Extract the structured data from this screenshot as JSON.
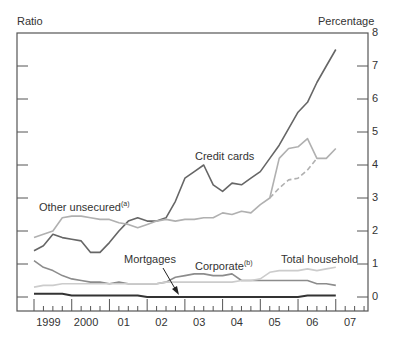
{
  "chart_data": {
    "type": "line",
    "title": "",
    "left_axis_label": "Ratio",
    "right_axis_label": "Percentage",
    "xlabel": "",
    "ylim": [
      0,
      8
    ],
    "yticks": [
      "0",
      "1",
      "2",
      "3",
      "4",
      "5",
      "6",
      "7",
      "8"
    ],
    "x_tick_labels": [
      "1999",
      "2000",
      "01",
      "02",
      "03",
      "04",
      "05",
      "06",
      "07"
    ],
    "x_frequency": "quarterly",
    "x_start": "1999 Q1",
    "grid": false,
    "series": [
      {
        "name": "Credit cards",
        "axis": "right",
        "style": "dark solid",
        "color": "#666666",
        "values": [
          1.4,
          1.55,
          1.9,
          1.8,
          1.75,
          1.7,
          1.35,
          1.35,
          1.65,
          2.0,
          2.3,
          2.4,
          2.3,
          2.3,
          2.4,
          2.9,
          3.6,
          3.8,
          4.0,
          3.4,
          3.2,
          3.45,
          3.4,
          3.6,
          3.8,
          4.2,
          4.6,
          5.1,
          5.6,
          5.9,
          6.5,
          7.0,
          7.5
        ]
      },
      {
        "name": "Other unsecured (a)",
        "axis": "right",
        "style": "light solid",
        "color": "#b0b0b0",
        "values": [
          1.8,
          1.9,
          2.0,
          2.4,
          2.45,
          2.45,
          2.4,
          2.35,
          2.35,
          2.25,
          2.2,
          2.1,
          2.2,
          2.3,
          2.35,
          2.3,
          2.35,
          2.35,
          2.4,
          2.4,
          2.55,
          2.5,
          2.6,
          2.55,
          2.8,
          3.0,
          4.2,
          4.5,
          4.55,
          4.8,
          4.2,
          4.2,
          4.5
        ]
      },
      {
        "name": "Other unsecured (a) — alternative",
        "axis": "right",
        "style": "light dashed",
        "color": "#b0b0b0",
        "values": [
          null,
          null,
          null,
          null,
          null,
          null,
          null,
          null,
          null,
          null,
          null,
          null,
          null,
          null,
          null,
          null,
          null,
          null,
          null,
          null,
          null,
          null,
          null,
          null,
          null,
          3.0,
          3.3,
          3.55,
          3.6,
          3.85,
          4.2,
          null,
          null
        ]
      },
      {
        "name": "Corporate (b)",
        "axis": "left",
        "style": "medium solid",
        "color": "#8c8c8c",
        "values": [
          1.1,
          0.9,
          0.8,
          0.65,
          0.55,
          0.5,
          0.45,
          0.45,
          0.4,
          0.45,
          0.4,
          0.4,
          0.4,
          0.4,
          0.45,
          0.6,
          0.65,
          0.7,
          0.7,
          0.65,
          0.65,
          0.7,
          0.5,
          0.5,
          0.5,
          0.5,
          0.5,
          0.5,
          0.5,
          0.5,
          0.4,
          0.4,
          0.35
        ]
      },
      {
        "name": "Total household",
        "axis": "left",
        "style": "very light solid",
        "color": "#cccccc",
        "values": [
          0.3,
          0.35,
          0.35,
          0.4,
          0.4,
          0.4,
          0.4,
          0.4,
          0.4,
          0.4,
          0.4,
          0.4,
          0.4,
          0.4,
          0.45,
          0.45,
          0.45,
          0.45,
          0.45,
          0.45,
          0.45,
          0.45,
          0.5,
          0.5,
          0.55,
          0.75,
          0.8,
          0.8,
          0.8,
          0.85,
          0.8,
          0.85,
          0.9
        ]
      },
      {
        "name": "Mortgages",
        "axis": "right",
        "style": "darkest solid",
        "color": "#333333",
        "values": [
          0.1,
          0.1,
          0.1,
          0.1,
          0.05,
          0.05,
          0.05,
          0.05,
          0.05,
          0.05,
          0.05,
          0.05,
          0.0,
          0.0,
          0.0,
          0.0,
          0.0,
          0.0,
          0.0,
          0.0,
          0.0,
          0.0,
          0.0,
          0.0,
          0.0,
          0.0,
          0.0,
          0.0,
          0.0,
          0.05,
          0.05,
          0.05,
          0.05
        ]
      }
    ],
    "annotations": [
      "Credit cards",
      "Other unsecured(a)",
      "Mortgages",
      "Corporate(b)",
      "Total household"
    ]
  },
  "labels": {
    "ratio": "Ratio",
    "percentage": "Percentage",
    "credit_cards": "Credit cards",
    "other_unsecured": "Other unsecured",
    "other_unsecured_sup": "(a)",
    "mortgages": "Mortgages",
    "corporate": "Corporate",
    "corporate_sup": "(b)",
    "total_household": "Total household"
  },
  "yticks": [
    "8",
    "7",
    "6",
    "5",
    "4",
    "3",
    "2",
    "1",
    "0"
  ],
  "xticks": [
    "1999",
    "2000",
    "01",
    "02",
    "03",
    "04",
    "05",
    "06",
    "07"
  ]
}
